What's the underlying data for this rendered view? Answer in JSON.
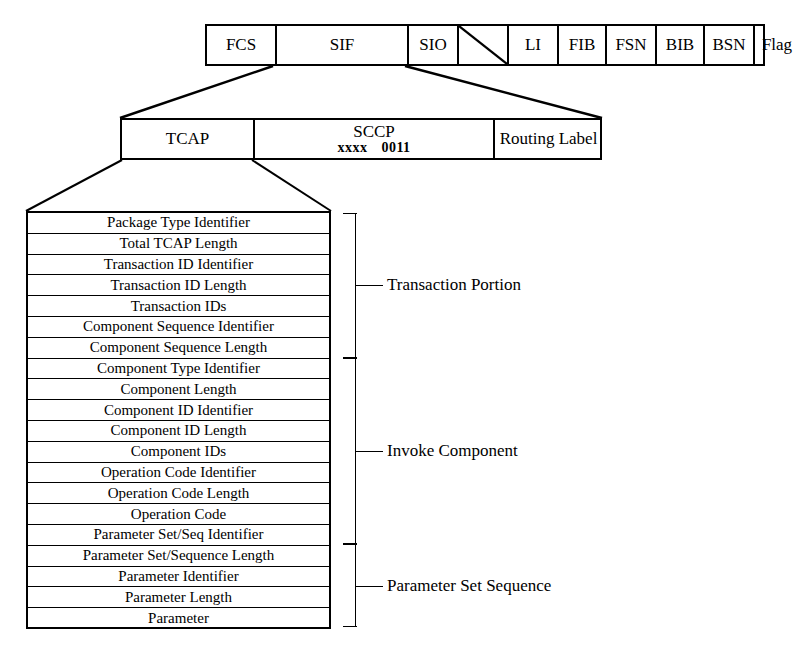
{
  "diagram": {
    "line_color": "#000000",
    "background": "#ffffff"
  },
  "msu_row": {
    "name": "Message Signal Unit fields",
    "cells": [
      {
        "label": "FCS",
        "width": 68,
        "type": "text"
      },
      {
        "label": "SIF",
        "width": 132,
        "type": "text"
      },
      {
        "label": "SIO",
        "width": 50,
        "type": "text"
      },
      {
        "label": "",
        "width": 50,
        "type": "diagonal"
      },
      {
        "label": "LI",
        "width": 50,
        "type": "text"
      },
      {
        "label": "FIB",
        "width": 48,
        "type": "text"
      },
      {
        "label": "FSN",
        "width": 50,
        "type": "text"
      },
      {
        "label": "BIB",
        "width": 48,
        "type": "text"
      },
      {
        "label": "BSN",
        "width": 50,
        "type": "text"
      },
      {
        "label": "Flag",
        "width": 46,
        "type": "text"
      }
    ]
  },
  "sif_row": {
    "name": "Signaling Information Field breakdown",
    "cells": [
      {
        "label": "TCAP",
        "width": 131,
        "type": "text"
      },
      {
        "label": "SCCP",
        "width": 240,
        "type": "two-line",
        "bits_x": "xxxx",
        "bits_value": "0011"
      },
      {
        "label": "Routing Label",
        "width": 109,
        "type": "text"
      }
    ]
  },
  "tcap_fields": [
    "Package Type Identifier",
    "Total TCAP Length",
    "Transaction ID Identifier",
    "Transaction ID Length",
    "Transaction IDs",
    "Component Sequence Identifier",
    "Component Sequence Length",
    "Component Type Identifier",
    "Component Length",
    "Component ID Identifier",
    "Component ID Length",
    "Component IDs",
    "Operation Code Identifier",
    "Operation Code Length",
    "Operation Code",
    "Parameter Set/Seq Identifier",
    "Parameter Set/Sequence Length",
    "Parameter Identifier",
    "Parameter Length",
    "Parameter"
  ],
  "brackets": [
    {
      "label": "Transaction Portion",
      "first_field": 0,
      "last_field": 6
    },
    {
      "label": "Invoke Component",
      "first_field": 7,
      "last_field": 15
    },
    {
      "label": "Parameter Set Sequence",
      "first_field": 16,
      "last_field": 19
    }
  ]
}
